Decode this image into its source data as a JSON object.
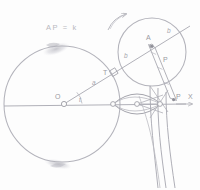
{
  "figure": {
    "title_note": "AP = k",
    "ink_color": "#9b9ba3",
    "faint_color": "#c9c9d0",
    "paper_color": "#fdfdfd"
  },
  "labels": {
    "equation": "AP = k",
    "center": "O",
    "tangency": "T",
    "rolling_center": "A",
    "point_p_small": "P",
    "point_p_axis": "P",
    "axis": "X",
    "radius_a": "a",
    "radius_b_left": "b",
    "radius_b_right": "b",
    "angle_t": "t"
  },
  "geometry": {
    "base_circle": {
      "cx": 62,
      "cy": 104,
      "r": 58,
      "label": "base-circle"
    },
    "rolling_circle": {
      "cx": 152,
      "cy": 52,
      "r": 34,
      "label": "rolling-circle"
    },
    "axis_line": {
      "x1": 4,
      "y1": 106,
      "x2": 190,
      "y2": 104,
      "label": "axis-OX"
    },
    "radius_line": {
      "x1": 64,
      "y1": 104,
      "x2": 186,
      "y2": 28,
      "label": "line-O-to-A"
    },
    "tangency_marker": {
      "x": 112,
      "y": 72,
      "size": 6
    },
    "nodes_on_axis": [
      {
        "cx": 64,
        "cy": 104
      },
      {
        "cx": 113,
        "cy": 104
      },
      {
        "cx": 137,
        "cy": 104
      },
      {
        "cx": 160,
        "cy": 104
      },
      {
        "cx": 176,
        "cy": 103
      }
    ],
    "strip": {
      "from": {
        "x": 150,
        "y": 46
      },
      "to": {
        "x": 172,
        "y": 101
      },
      "width": 7,
      "tick_count": 3
    },
    "rotation_arrow": {
      "cx": 116,
      "cy": 22,
      "note": "curved arrow showing rolling direction"
    }
  },
  "smudges": [
    {
      "cx": 56,
      "cy": 49,
      "rx": 13,
      "ry": 5,
      "rot": -18
    },
    {
      "cx": 57,
      "cy": 164,
      "rx": 13,
      "ry": 4,
      "rot": 12
    }
  ]
}
